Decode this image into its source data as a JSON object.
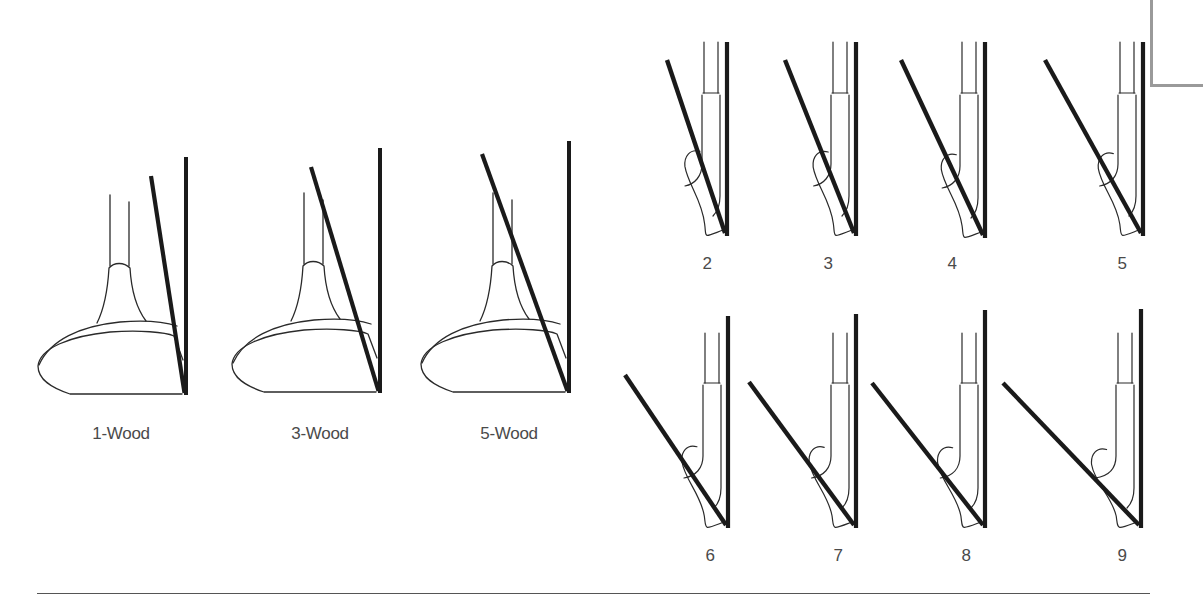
{
  "diagram": {
    "woods": [
      {
        "label": "1-Wood",
        "bar_x": 186,
        "bar_top": 157,
        "bar_bottom": 395,
        "slant_x": 151,
        "slant_y": 176,
        "label_x": 121,
        "label_y": 424
      },
      {
        "label": "3-Wood",
        "bar_x": 380,
        "bar_top": 148,
        "bar_bottom": 393,
        "slant_x": 311,
        "slant_y": 167,
        "label_x": 320,
        "label_y": 424
      },
      {
        "label": "5-Wood",
        "bar_x": 569,
        "bar_top": 141,
        "bar_bottom": 393,
        "slant_x": 482,
        "slant_y": 154,
        "label_x": 509,
        "label_y": 424
      }
    ],
    "irons": [
      {
        "label": "2",
        "bar_x": 727,
        "bar_top": 42,
        "bar_bottom": 236,
        "slant_x": 667,
        "slant_y": 60,
        "label_x": 707,
        "label_y": 254,
        "row": "top"
      },
      {
        "label": "3",
        "bar_x": 856,
        "bar_top": 42,
        "bar_bottom": 236,
        "slant_x": 785,
        "slant_y": 60,
        "label_x": 828,
        "label_y": 254,
        "row": "top"
      },
      {
        "label": "4",
        "bar_x": 985,
        "bar_top": 42,
        "bar_bottom": 238,
        "slant_x": 901,
        "slant_y": 60,
        "label_x": 952,
        "label_y": 254,
        "row": "top"
      },
      {
        "label": "5",
        "bar_x": 1143,
        "bar_top": 42,
        "bar_bottom": 236,
        "slant_x": 1045,
        "slant_y": 60,
        "label_x": 1122,
        "label_y": 254,
        "row": "top"
      },
      {
        "label": "6",
        "bar_x": 728,
        "bar_top": 316,
        "bar_bottom": 528,
        "slant_x": 625,
        "slant_y": 375,
        "label_x": 710,
        "label_y": 546,
        "row": "bottom"
      },
      {
        "label": "7",
        "bar_x": 856,
        "bar_top": 314,
        "bar_bottom": 528,
        "slant_x": 749,
        "slant_y": 382,
        "label_x": 838,
        "label_y": 546,
        "row": "bottom"
      },
      {
        "label": "8",
        "bar_x": 985,
        "bar_top": 310,
        "bar_bottom": 528,
        "slant_x": 872,
        "slant_y": 383,
        "label_x": 966,
        "label_y": 546,
        "row": "bottom"
      },
      {
        "label": "9",
        "bar_x": 1141,
        "bar_top": 309,
        "bar_bottom": 528,
        "slant_x": 1003,
        "slant_y": 383,
        "label_x": 1122,
        "label_y": 546,
        "row": "bottom"
      }
    ],
    "colors": {
      "ink": "#1a1a1a",
      "outline": "#2a2a2a",
      "label": "#4a4a4a",
      "bracket": "#9a9a9a",
      "rule": "#555555"
    }
  }
}
